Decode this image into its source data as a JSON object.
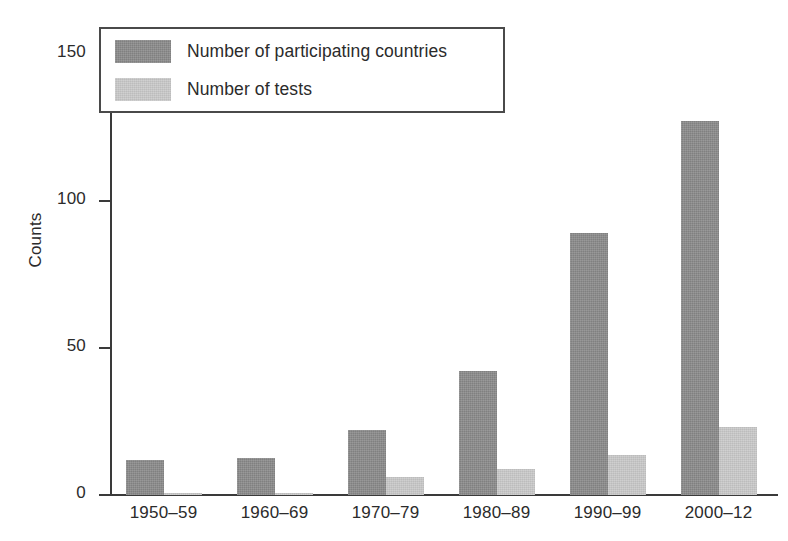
{
  "chart_data": {
    "type": "bar",
    "title": "",
    "xlabel": "",
    "ylabel": "Counts",
    "categories": [
      "1950–59",
      "1960–69",
      "1970–79",
      "1980–89",
      "1990–99",
      "2000–12"
    ],
    "series": [
      {
        "name": "Number of participating countries",
        "color": "#8d8d8d",
        "values": [
          12,
          12.5,
          22,
          42,
          89,
          127
        ]
      },
      {
        "name": "Number of tests",
        "color": "#c9c9c9",
        "values": [
          0.7,
          0.8,
          6,
          9,
          13.5,
          23
        ]
      }
    ],
    "ylim": [
      0,
      158
    ],
    "yticks": [
      0,
      50,
      100,
      150
    ],
    "ytick_labels": [
      "0",
      "50",
      "100",
      "150"
    ],
    "grid": false,
    "legend_position": "top-left",
    "axis_color": "#3a3a3a"
  },
  "axes": {
    "y_axis_title": "Counts"
  },
  "legend": {
    "entries": [
      {
        "label": "Number of participating countries",
        "color": "#8d8d8d"
      },
      {
        "label": "Number of tests",
        "color": "#c9c9c9"
      }
    ]
  }
}
